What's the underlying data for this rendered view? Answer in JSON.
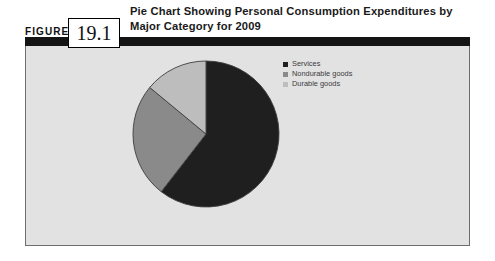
{
  "figure": {
    "label": "FIGURE",
    "number": "19.1",
    "title": "Pie Chart Showing Personal Consumption Expenditures by Major Category for 2009"
  },
  "colors": {
    "series_services": "#1f1f1f",
    "series_nondurable": "#8a8a8a",
    "series_durable": "#bdbdbd",
    "panel_background": "#e2e2e2",
    "panel_border": "#6d6d6d",
    "rule": "#141414",
    "slice_outline": "#3d3d3d"
  },
  "legend": {
    "items": [
      {
        "label": "Services",
        "color": "#1f1f1f"
      },
      {
        "label": "Nondurable goods",
        "color": "#8a8a8a"
      },
      {
        "label": "Durable goods",
        "color": "#bdbdbd"
      }
    ]
  },
  "chart_data": {
    "type": "pie",
    "title": "Pie Chart Showing Personal Consumption Expenditures by Major Category for 2009",
    "xlabel": "",
    "ylabel": "",
    "legend_position": "right",
    "grid": false,
    "start_angle_deg": 0,
    "direction": "clockwise",
    "categories": [
      "Services",
      "Nondurable goods",
      "Durable goods"
    ],
    "values": [
      60.5,
      25.5,
      14.0
    ],
    "units": "percent",
    "slices": [
      {
        "label": "Services",
        "value": 60.5,
        "color": "#1f1f1f",
        "start_deg": 0,
        "end_deg": 217.8
      },
      {
        "label": "Nondurable goods",
        "value": 25.5,
        "color": "#8a8a8a",
        "start_deg": 217.8,
        "end_deg": 309.6
      },
      {
        "label": "Durable goods",
        "value": 14.0,
        "color": "#bdbdbd",
        "start_deg": 309.6,
        "end_deg": 360
      }
    ]
  }
}
